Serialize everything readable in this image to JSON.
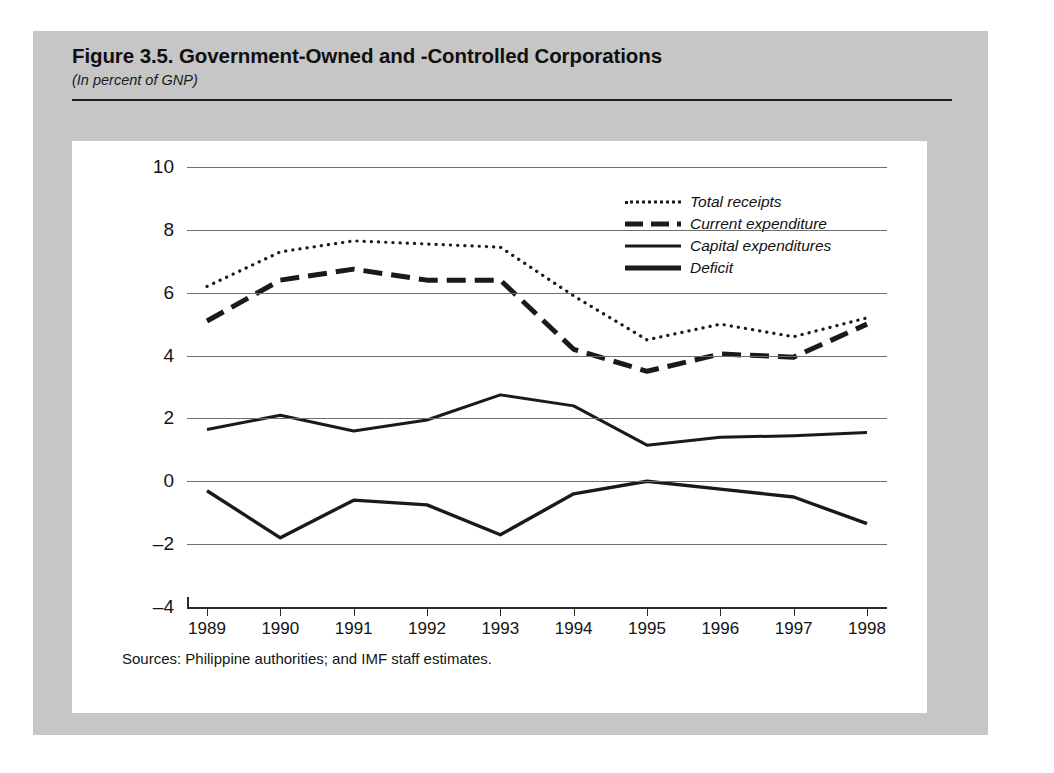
{
  "figure": {
    "title": "Figure 3.5.  Government-Owned and -Controlled Corporations",
    "subtitle": "(In percent of GNP)",
    "source_note": "Sources:  Philippine authorities; and IMF staff estimates."
  },
  "legend": {
    "position": "inside-top-right",
    "entries": [
      {
        "label": "Total receipts",
        "style": "dotted"
      },
      {
        "label": "Current expenditure",
        "style": "dashed"
      },
      {
        "label": "Capital expenditures",
        "style": "thin-solid"
      },
      {
        "label": "Deficit",
        "style": "thick-solid"
      }
    ]
  },
  "chart_data": {
    "type": "line",
    "title": "Figure 3.5.  Government-Owned and -Controlled Corporations",
    "subtitle": "(In percent of GNP)",
    "xlabel": "",
    "ylabel": "",
    "ylim": [
      -4,
      10
    ],
    "yticks": [
      10,
      8,
      6,
      4,
      2,
      0,
      -2,
      -4
    ],
    "ytick_labels": [
      "10",
      "8",
      "6",
      "4",
      "2",
      "0",
      "–2",
      "–4"
    ],
    "grid": true,
    "x": [
      1989,
      1990,
      1991,
      1992,
      1993,
      1994,
      1995,
      1996,
      1997,
      1998
    ],
    "categories": [
      "1989",
      "1990",
      "1991",
      "1992",
      "1993",
      "1994",
      "1995",
      "1996",
      "1997",
      "1998"
    ],
    "series": [
      {
        "name": "Total receipts",
        "style": "dotted",
        "values": [
          6.2,
          7.3,
          7.65,
          7.55,
          7.45,
          5.9,
          4.5,
          5.0,
          4.6,
          5.2
        ]
      },
      {
        "name": "Current expenditure",
        "style": "dashed",
        "values": [
          5.1,
          6.4,
          6.75,
          6.4,
          6.4,
          4.2,
          3.5,
          4.05,
          3.95,
          5.0
        ]
      },
      {
        "name": "Capital expenditures",
        "style": "thin-solid",
        "values": [
          1.65,
          2.1,
          1.6,
          1.95,
          2.75,
          2.4,
          1.15,
          1.4,
          1.45,
          1.55
        ]
      },
      {
        "name": "Deficit",
        "style": "thick-solid",
        "values": [
          -0.3,
          -1.8,
          -0.6,
          -0.75,
          -1.7,
          -0.4,
          0.0,
          -0.25,
          -0.5,
          -1.35
        ]
      }
    ]
  },
  "colors": {
    "page_background": "#c6c6c6",
    "panel_background": "#ffffff",
    "ink": "#1a1a1a",
    "gridline": "#6e6e6e"
  }
}
